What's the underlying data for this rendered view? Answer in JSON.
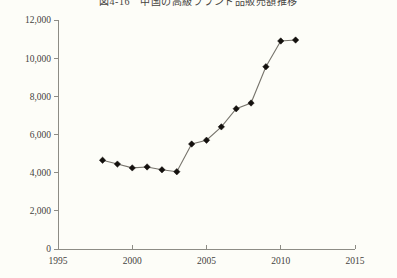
{
  "chart_data": {
    "type": "line",
    "title": "図4-16　中国の高級ブランド品販売額推移",
    "xlabel": "",
    "ylabel": "",
    "x": [
      1998,
      1999,
      2000,
      2001,
      2002,
      2003,
      2004,
      2005,
      2006,
      2007,
      2008,
      2009,
      2010,
      2011
    ],
    "values": [
      4650,
      4450,
      4250,
      4300,
      4150,
      4050,
      5500,
      5700,
      6400,
      7350,
      7650,
      9550,
      10900,
      10950
    ],
    "series": [
      {
        "name": "販売額",
        "values": [
          4650,
          4450,
          4250,
          4300,
          4150,
          4050,
          5500,
          5700,
          6400,
          7350,
          7650,
          9550,
          10900,
          10950
        ]
      }
    ],
    "xlim": [
      1995,
      2015
    ],
    "ylim": [
      0,
      12000
    ],
    "x_ticks": [
      1995,
      2000,
      2005,
      2010,
      2015
    ],
    "x_tick_labels": [
      "1995",
      "2000",
      "2005",
      "2010",
      "2015"
    ],
    "y_ticks": [
      0,
      2000,
      4000,
      6000,
      8000,
      10000,
      12000
    ],
    "y_tick_labels": [
      "0",
      "2,000",
      "4,000",
      "6,000",
      "8,000",
      "10,000",
      "12,000"
    ],
    "grid": false,
    "legend": false,
    "legend_position": "none",
    "marker": "diamond",
    "line_color": "#77746c",
    "marker_color": "#14110e",
    "background_color": "#fdfdf8",
    "axis_color": "#8d8c85"
  }
}
